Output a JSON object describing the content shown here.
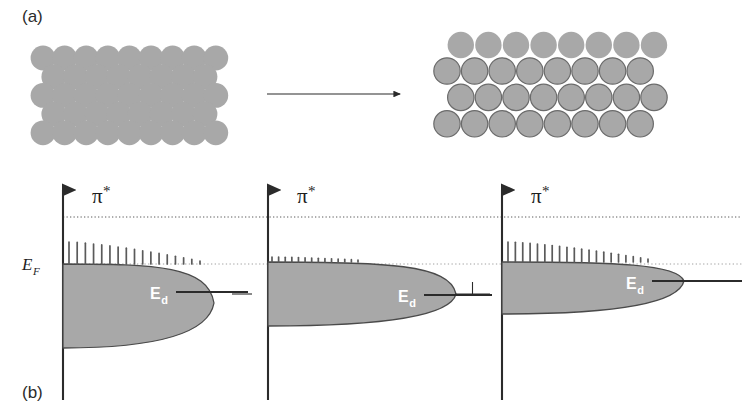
{
  "figure": {
    "panels": [
      {
        "id": "a",
        "label": "(a)",
        "x": 22,
        "y": 22
      },
      {
        "id": "b",
        "label": "(b)",
        "x": 22,
        "y": 398
      }
    ],
    "colors": {
      "atom_fill": "#a8a8a8",
      "atom_outline": "#6b6b6b",
      "band_fill": "#a8a8a8",
      "band_outline": "#4a4a4a",
      "axis": "#2b2b2b",
      "dotted_pi": "#5a5a5a",
      "dotted_ef": "#a0a0a0",
      "ed_line": "#2b2b2b",
      "comb": "#5a5a5a",
      "background": "#ffffff",
      "label_text": "#2b2b2b",
      "ed_text": "#ffffff"
    }
  },
  "lattices": {
    "left": {
      "name": "unstrained-close-packed-lattice",
      "radius": 12.4,
      "dx": 21.6,
      "dy": 18.7,
      "origin_x": 43,
      "origin_y": 58,
      "rows": 5,
      "cols": 8,
      "style": "filled-no-outline",
      "note": "close-packed hexagonal rows, alternating half-offset"
    },
    "right": {
      "name": "strained-expanded-lattice",
      "radius": 13.2,
      "dx": 27.6,
      "dy": 26.4,
      "origin_x": 447,
      "origin_y": 45,
      "rows": 4,
      "cols": 8,
      "style": "top-row-filled-rest-outlined",
      "note": "expanded overlayer: separated top row above three outlined rows"
    }
  },
  "arrow": {
    "name": "transformation-arrow",
    "x1": 267,
    "y1": 94,
    "x2": 400,
    "y2": 94
  },
  "reference_lines": {
    "pi_star": {
      "label": "pi-star-level",
      "y": 217,
      "x1": 63,
      "x2": 742,
      "style": "dotted"
    },
    "fermi": {
      "label": "fermi-level",
      "y": 264,
      "x1": 63,
      "x2": 742,
      "style": "dotted"
    }
  },
  "axis_label_ef": {
    "text": "E",
    "sub": "F",
    "x": 22,
    "y": 270
  },
  "band_panels": [
    {
      "id": "panel-1",
      "axis_x": 63,
      "axis_top": 190,
      "axis_bottom": 400,
      "pi_label": {
        "text": "π",
        "star": "*",
        "x": 92,
        "y": 203
      },
      "band": {
        "top_y": 264,
        "bottom_y": 348,
        "tip_x": 214,
        "nose_y": 303
      },
      "ed": {
        "label": "E",
        "sub": "d",
        "text_x": 150,
        "text_y": 299,
        "line_x1": 176,
        "line_x2": 248,
        "line_y": 292
      },
      "comb": {
        "count": 17,
        "x_start": 69,
        "x_end": 200,
        "base_y": 264,
        "max_height": 22,
        "min_height": 3
      },
      "left_tick": null
    },
    {
      "id": "panel-2",
      "axis_x": 268,
      "axis_top": 190,
      "axis_bottom": 400,
      "pi_label": {
        "text": "π",
        "star": "*",
        "x": 297,
        "y": 203
      },
      "band": {
        "top_y": 262,
        "bottom_y": 326,
        "tip_x": 456,
        "nose_y": 294
      },
      "ed": {
        "label": "E",
        "sub": "d",
        "text_x": 398,
        "text_y": 302,
        "line_x1": 424,
        "line_x2": 492,
        "line_y": 295
      },
      "comb": {
        "count": 14,
        "x_start": 272,
        "x_end": 358,
        "base_y": 262,
        "max_height": 5,
        "min_height": 2
      },
      "left_tick": {
        "x1": 232,
        "x2": 252,
        "y": 294
      }
    },
    {
      "id": "panel-3",
      "axis_x": 502,
      "axis_top": 190,
      "axis_bottom": 400,
      "pi_label": {
        "text": "π",
        "star": "*",
        "x": 531,
        "y": 203
      },
      "band": {
        "top_y": 262,
        "bottom_y": 314,
        "tip_x": 684,
        "nose_y": 281
      },
      "ed": {
        "label": "E",
        "sub": "d",
        "text_x": 626,
        "text_y": 289,
        "line_x1": 652,
        "line_x2": 742,
        "line_y": 281
      },
      "comb": {
        "count": 20,
        "x_start": 508,
        "x_end": 648,
        "base_y": 262,
        "max_height": 20,
        "min_height": 3
      },
      "left_tick": {
        "x1": 455,
        "x2": 490,
        "y": 294,
        "has_vertical": true
      }
    }
  ]
}
